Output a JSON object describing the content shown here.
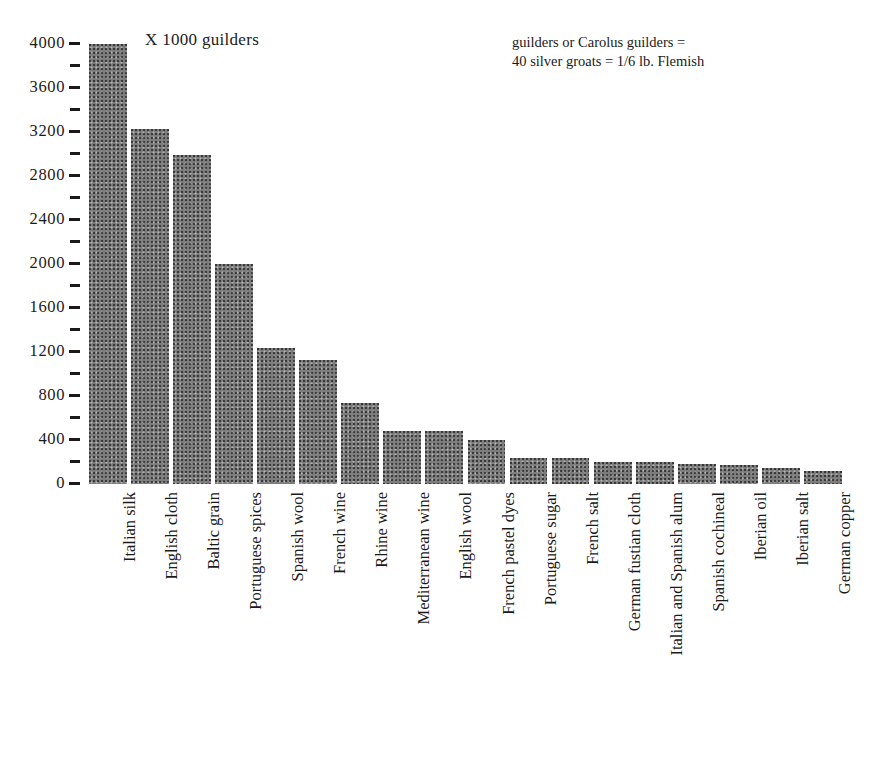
{
  "annotations": {
    "unit_note": "X 1000 guilders",
    "currency_note_line1": "guilders or Carolus guilders =",
    "currency_note_line2": "40 silver groats = 1/6 lb. Flemish"
  },
  "axis": {
    "y_ticks_major": [
      "0",
      "400",
      "800",
      "1200",
      "1600",
      "2000",
      "2400",
      "2800",
      "3200",
      "3600",
      "4000"
    ],
    "y_ticks_minor": [
      "200",
      "600",
      "1000",
      "1400",
      "1800",
      "2200",
      "2600",
      "3000",
      "3400",
      "3800"
    ]
  },
  "chart_data": {
    "type": "bar",
    "title": "",
    "subtitle": "",
    "xlabel": "",
    "ylabel": "X 1000 guilders",
    "ylim": [
      0,
      4000
    ],
    "ytick_interval_major": 400,
    "ytick_interval_minor": 200,
    "grid": false,
    "legend": "none",
    "orientation": "vertical",
    "bar_color": "#7d7d7d",
    "categories": [
      "Italian silk",
      "English cloth",
      "Baltic grain",
      "Portuguese spices",
      "Spanish wool",
      "French wine",
      "Rhine wine",
      "Mediterranean wine",
      "English wool",
      "French pastel dyes",
      "Portuguese sugar",
      "French salt",
      "German fustian cloth",
      "Italian and Spanish alum",
      "Spanish cochineal",
      "Iberian oil",
      "Iberian salt",
      "German copper"
    ],
    "values": [
      4000,
      3230,
      2990,
      2000,
      1240,
      1130,
      740,
      480,
      480,
      400,
      240,
      240,
      200,
      200,
      180,
      170,
      150,
      120
    ],
    "annotations": [
      "X 1000 guilders",
      "guilders or Carolus guilders = 40 silver groats = 1/6 lb. Flemish"
    ]
  }
}
